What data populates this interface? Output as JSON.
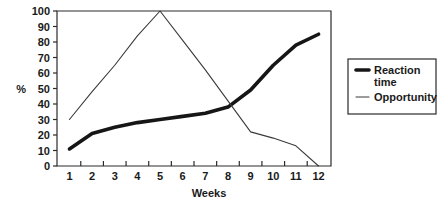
{
  "chart_data": {
    "type": "line",
    "title": "",
    "xlabel": "Weeks",
    "ylabel": "%",
    "x": [
      1,
      2,
      3,
      4,
      5,
      6,
      7,
      8,
      9,
      10,
      11,
      12
    ],
    "xticklabels": [
      "1",
      "2",
      "3",
      "4",
      "5",
      "6",
      "7",
      "8",
      "9",
      "10",
      "11",
      "12"
    ],
    "yticklabels": [
      "0",
      "10",
      "20",
      "30",
      "40",
      "50",
      "60",
      "70",
      "80",
      "90",
      "100"
    ],
    "yticks": [
      0,
      10,
      20,
      30,
      40,
      50,
      60,
      70,
      80,
      90,
      100
    ],
    "xlim": [
      0.45,
      12.55
    ],
    "ylim": [
      0,
      100
    ],
    "grid": false,
    "legend_position": "right-outside",
    "series": [
      {
        "name": "Reaction time",
        "style": "thick",
        "color": "#161616",
        "values": [
          11,
          21,
          25,
          28,
          30,
          32,
          34,
          38,
          49,
          65,
          78,
          85
        ]
      },
      {
        "name": "Opportunity",
        "style": "thin",
        "color": "#3a3a3a",
        "values": [
          30,
          48,
          65,
          84,
          100,
          81,
          62,
          42,
          22,
          18,
          13,
          0
        ]
      }
    ]
  },
  "legend": {
    "entries": [
      {
        "label": "Reaction time",
        "line_style": "thick"
      },
      {
        "label": "Opportunity",
        "line_style": "thin"
      }
    ]
  },
  "axes": {
    "y_axis_title": "%",
    "x_axis_title": "Weeks"
  }
}
